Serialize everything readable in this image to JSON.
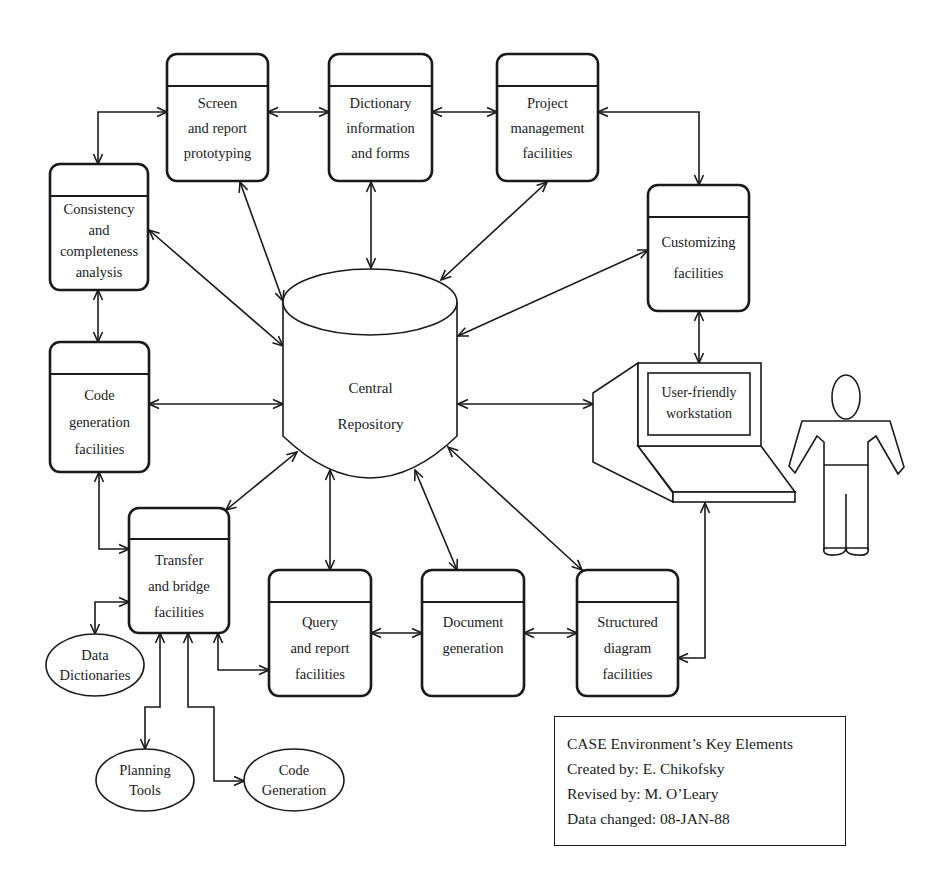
{
  "diagram": {
    "colors": {
      "ink": "#1a1a1a",
      "background": "#ffffff"
    },
    "central": {
      "lines": [
        "Central",
        "Repository"
      ]
    },
    "boxes": [
      {
        "id": "screen",
        "lines": [
          "Screen",
          "and report",
          "prototyping"
        ]
      },
      {
        "id": "dictionary",
        "lines": [
          "Dictionary",
          "information",
          "and forms"
        ]
      },
      {
        "id": "project",
        "lines": [
          "Project",
          "management",
          "facilities"
        ]
      },
      {
        "id": "customizing",
        "lines": [
          "Customizing",
          "facilities"
        ]
      },
      {
        "id": "consistency",
        "lines": [
          "Consistency",
          "and",
          "completeness",
          "analysis"
        ]
      },
      {
        "id": "codegen",
        "lines": [
          "Code",
          "generation",
          "facilities"
        ]
      },
      {
        "id": "transfer",
        "lines": [
          "Transfer",
          "and bridge",
          "facilities"
        ]
      },
      {
        "id": "query",
        "lines": [
          "Query",
          "and report",
          "facilities"
        ]
      },
      {
        "id": "document",
        "lines": [
          "Document",
          "generation"
        ]
      },
      {
        "id": "structured",
        "lines": [
          "Structured",
          "diagram",
          "facilities"
        ]
      }
    ],
    "workstation": {
      "lines": [
        "User-friendly",
        "workstation"
      ]
    },
    "ellipses": [
      {
        "id": "data-dictionaries",
        "lines": [
          "Data",
          "Dictionaries"
        ]
      },
      {
        "id": "planning-tools",
        "lines": [
          "Planning",
          "Tools"
        ]
      },
      {
        "id": "code-generation",
        "lines": [
          "Code",
          "Generation"
        ]
      }
    ],
    "legend": {
      "lines": [
        "CASE Environment’s Key Elements",
        "Created by: E. Chikofsky",
        "Revised by: M. O’Leary",
        "Data changed: 08-JAN-88"
      ]
    }
  }
}
